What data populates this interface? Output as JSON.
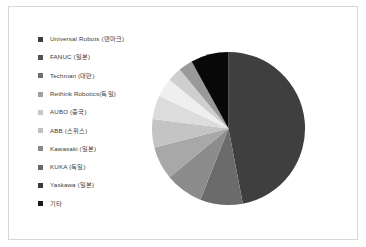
{
  "chart_data": {
    "type": "pie",
    "title": "",
    "subtitle": "",
    "xlabel": "",
    "ylabel": "",
    "legend_position": "left",
    "grid": false,
    "categories": [
      "Universal Robots (덴마크)",
      "FANUC (일본)",
      "Techman (대만)",
      "Rethink Robotics(독일)",
      "AUBO (중국)",
      "ABB (스위스)",
      "Kawasaki (일본)",
      "KUKA (독일)",
      "Yaskawa (일본)",
      "기타"
    ],
    "values": [
      47,
      9,
      8,
      7,
      6,
      5,
      4,
      3,
      3,
      8
    ],
    "colors": [
      "#3f3f3f",
      "#6b6b6b",
      "#8c8c8c",
      "#a8a8a8",
      "#c4c4c4",
      "#dcdcdc",
      "#efefef",
      "#cfcfcf",
      "#9a9a9a",
      "#080808"
    ]
  },
  "legend": {
    "items": [
      {
        "label": "Universal Robots (덴마크)",
        "color": "#3f3f3f"
      },
      {
        "label": "FANUC (일본)",
        "color": "#545454"
      },
      {
        "label": "Techman (대만)",
        "color": "#6f6f6f"
      },
      {
        "label": "Rethink Robotics(독일)",
        "color": "#a0a0a0"
      },
      {
        "label": "AUBO (중국)",
        "color": "#c8c8c8"
      },
      {
        "label": "ABB (스위스)",
        "color": "#c0c0c0"
      },
      {
        "label": "Kawasaki (일본)",
        "color": "#8a8a8a"
      },
      {
        "label": "KUKA (독일)",
        "color": "#6a6a6a"
      },
      {
        "label": "Yaskawa (일본)",
        "color": "#3c3c3c"
      },
      {
        "label": "기타",
        "color": "#1a1a1a"
      }
    ]
  },
  "figure": {
    "background": "#ffffff",
    "border_color": "#d8d8d8"
  }
}
